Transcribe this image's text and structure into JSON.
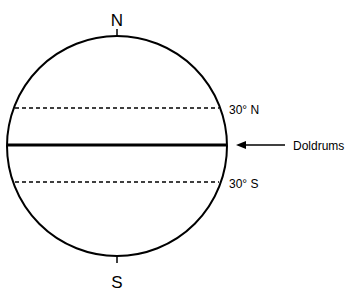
{
  "diagram": {
    "poles": {
      "north": "N",
      "south": "S"
    },
    "latitudes": [
      {
        "label": "30° N",
        "style": "dashed"
      },
      {
        "label": "30° S",
        "style": "dashed"
      }
    ],
    "equator": {
      "label": "Doldrums",
      "style": "solid-thick"
    },
    "colors": {
      "line": "#000000",
      "background": "#ffffff"
    }
  }
}
